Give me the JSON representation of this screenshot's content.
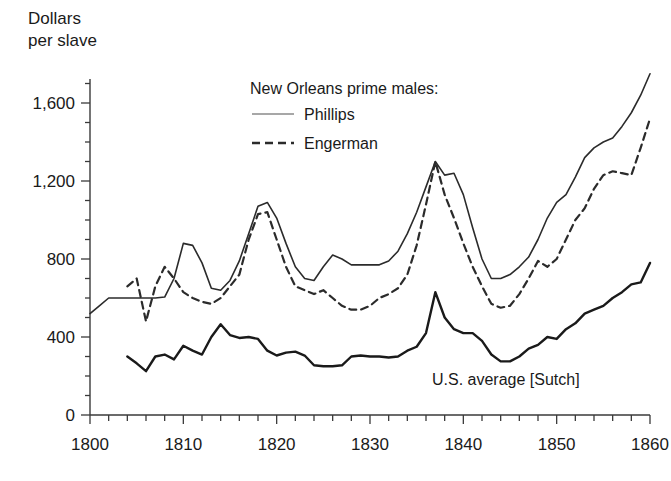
{
  "chart_data": {
    "type": "line",
    "title": "",
    "xlabel": "",
    "ylabel": "Dollars\nper slave",
    "ylabel_line1": "Dollars",
    "ylabel_line2": "per slave",
    "xlim": [
      1800,
      1860
    ],
    "ylim": [
      0,
      1800
    ],
    "grid": false,
    "x_ticks": [
      1800,
      1810,
      1820,
      1830,
      1840,
      1850,
      1860
    ],
    "x_tick_labels": [
      "1800",
      "1810",
      "1820",
      "1830",
      "1840",
      "1850",
      "1860"
    ],
    "x_minor_tick_step": 2,
    "y_ticks": [
      0,
      400,
      800,
      1200,
      1600
    ],
    "y_tick_labels": [
      "0",
      "400",
      "800",
      "1,200",
      "1,600"
    ],
    "y_minor_tick_step": 100,
    "legend_position": "upper-center",
    "legend_title": "New Orleans prime males:",
    "annotations": [
      {
        "text": "U.S. average [Sutch]",
        "x": 1845,
        "y": 300
      }
    ],
    "series": [
      {
        "name": "Phillips",
        "style": "solid",
        "color": "#2b2b2b",
        "width": 1.6,
        "x": [
          1800,
          1801,
          1802,
          1803,
          1804,
          1805,
          1806,
          1807,
          1808,
          1809,
          1810,
          1811,
          1812,
          1813,
          1814,
          1815,
          1816,
          1817,
          1818,
          1819,
          1820,
          1821,
          1822,
          1823,
          1824,
          1825,
          1826,
          1827,
          1828,
          1829,
          1830,
          1831,
          1832,
          1833,
          1834,
          1835,
          1836,
          1837,
          1838,
          1839,
          1840,
          1841,
          1842,
          1843,
          1844,
          1845,
          1846,
          1847,
          1848,
          1849,
          1850,
          1851,
          1852,
          1853,
          1854,
          1855,
          1856,
          1857,
          1858,
          1859,
          1860
        ],
        "values": [
          520,
          560,
          600,
          600,
          600,
          600,
          600,
          600,
          605,
          700,
          880,
          870,
          780,
          650,
          640,
          690,
          790,
          930,
          1070,
          1090,
          1010,
          880,
          760,
          700,
          690,
          760,
          820,
          800,
          770,
          770,
          770,
          770,
          790,
          840,
          930,
          1040,
          1170,
          1300,
          1230,
          1240,
          1130,
          960,
          800,
          700,
          700,
          720,
          760,
          810,
          900,
          1010,
          1090,
          1130,
          1220,
          1320,
          1370,
          1400,
          1420,
          1480,
          1550,
          1640,
          1750
        ]
      },
      {
        "name": "Engerman",
        "style": "dashed",
        "color": "#2b2b2b",
        "width": 2.2,
        "x": [
          1804,
          1805,
          1806,
          1807,
          1808,
          1809,
          1810,
          1811,
          1812,
          1813,
          1814,
          1815,
          1816,
          1817,
          1818,
          1819,
          1820,
          1821,
          1822,
          1823,
          1824,
          1825,
          1826,
          1827,
          1828,
          1829,
          1830,
          1831,
          1832,
          1833,
          1834,
          1835,
          1836,
          1837,
          1838,
          1839,
          1840,
          1841,
          1842,
          1843,
          1844,
          1845,
          1846,
          1847,
          1848,
          1849,
          1850,
          1851,
          1852,
          1853,
          1854,
          1855,
          1856,
          1857,
          1858,
          1859,
          1860
        ],
        "values": [
          660,
          700,
          480,
          660,
          760,
          700,
          630,
          600,
          580,
          570,
          600,
          660,
          720,
          900,
          1030,
          1040,
          900,
          760,
          660,
          640,
          620,
          640,
          600,
          560,
          540,
          540,
          560,
          600,
          620,
          650,
          720,
          870,
          1080,
          1300,
          1130,
          1010,
          880,
          760,
          660,
          570,
          550,
          560,
          620,
          700,
          790,
          760,
          800,
          900,
          1000,
          1060,
          1160,
          1230,
          1250,
          1240,
          1230,
          1370,
          1520
        ]
      },
      {
        "name": "U.S. average [Sutch]",
        "style": "solid",
        "color": "#1a1a1a",
        "width": 2.4,
        "x": [
          1804,
          1805,
          1806,
          1807,
          1808,
          1809,
          1810,
          1811,
          1812,
          1813,
          1814,
          1815,
          1816,
          1817,
          1818,
          1819,
          1820,
          1821,
          1822,
          1823,
          1824,
          1825,
          1826,
          1827,
          1828,
          1829,
          1830,
          1831,
          1832,
          1833,
          1834,
          1835,
          1836,
          1837,
          1838,
          1839,
          1840,
          1841,
          1842,
          1843,
          1844,
          1845,
          1846,
          1847,
          1848,
          1849,
          1850,
          1851,
          1852,
          1853,
          1854,
          1855,
          1856,
          1857,
          1858,
          1859,
          1860
        ],
        "values": [
          300,
          265,
          225,
          300,
          310,
          285,
          355,
          330,
          310,
          400,
          465,
          410,
          395,
          400,
          390,
          330,
          305,
          320,
          325,
          305,
          255,
          250,
          250,
          255,
          300,
          305,
          300,
          300,
          295,
          300,
          330,
          350,
          420,
          630,
          500,
          440,
          420,
          420,
          380,
          310,
          275,
          275,
          300,
          340,
          360,
          400,
          390,
          440,
          470,
          520,
          540,
          560,
          600,
          630,
          670,
          680,
          780
        ]
      }
    ]
  },
  "legend": {
    "title": "New Orleans prime males:",
    "entries": [
      {
        "label": "Phillips",
        "style": "solid"
      },
      {
        "label": "Engerman",
        "style": "dashed"
      }
    ]
  },
  "axes": {
    "y_title_line1": "Dollars",
    "y_title_line2": "per slave"
  },
  "annotation": {
    "us_average": "U.S. average [Sutch]"
  },
  "colors": {
    "line": "#2b2b2b",
    "axis": "#3a3a3a",
    "text": "#1a1a1a",
    "background": "#ffffff"
  }
}
